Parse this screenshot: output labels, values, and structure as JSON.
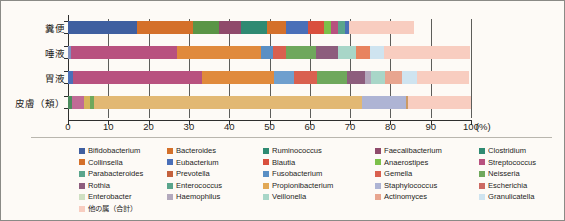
{
  "chart_data": {
    "type": "bar",
    "orientation": "horizontal",
    "stacked": true,
    "title": "",
    "xlabel": "(%)",
    "ylabel": "",
    "xlim": [
      0,
      100
    ],
    "xticks": [
      0,
      10,
      20,
      30,
      40,
      50,
      60,
      70,
      80,
      90,
      100
    ],
    "xtick_labels": [
      "0",
      "10",
      "20",
      "30",
      "40",
      "50",
      "60",
      "70",
      "80",
      "90",
      "100"
    ],
    "x_unit_label": "(%)",
    "grid": true,
    "grid_axis": "x",
    "legend_position": "below",
    "categories": [
      "糞便",
      "唾液",
      "胃液",
      "皮膚（頬）"
    ],
    "series": [
      {
        "name": "Bifidobacterium",
        "color": "#3f5fa0",
        "values": [
          17.0,
          0.0,
          0.8,
          0.0
        ]
      },
      {
        "name": "Bacteroides",
        "color": "#d4702a",
        "values": [
          31.0,
          0.0,
          0.0,
          0.0
        ]
      },
      {
        "name": "Ruminococcus",
        "color": "#5a9546",
        "values": [
          6.5,
          0.0,
          0.0,
          0.0
        ]
      },
      {
        "name": "Faecalibacterium",
        "color": "#8f4a6b",
        "values": [
          5.5,
          0.0,
          0.0,
          0.0
        ]
      },
      {
        "name": "Clostridium",
        "color": "#2f8a72",
        "values": [
          6.5,
          0.0,
          0.0,
          0.0
        ]
      },
      {
        "name": "Collinsella",
        "color": "#d4702a",
        "values": [
          4.5,
          0.0,
          0.0,
          0.0
        ]
      },
      {
        "name": "Eubacterium",
        "color": "#4a6fb8",
        "values": [
          5.5,
          0.0,
          0.0,
          0.0
        ]
      },
      {
        "name": "Blautia",
        "color": "#d94f3d",
        "values": [
          4.0,
          0.0,
          0.0,
          0.0
        ]
      },
      {
        "name": "Anaerostipes",
        "color": "#7cc04a",
        "values": [
          1.8,
          0.0,
          0.0,
          0.0
        ]
      },
      {
        "name": "Streptococcus",
        "color": "#b8517f",
        "values": [
          1.8,
          26.6,
          32.0,
          2.8
        ]
      },
      {
        "name": "Parabacteroides",
        "color": "#5aa58c",
        "values": [
          1.6,
          0.0,
          0.0,
          0.0
        ]
      },
      {
        "name": "Prevotella",
        "color": "#c4613d",
        "values": [
          0.0,
          21.0,
          18.0,
          0.0
        ]
      },
      {
        "name": "Fusobacterium",
        "color": "#5a8fc4",
        "values": [
          0.0,
          3.0,
          5.0,
          0.0
        ]
      },
      {
        "name": "Gemella",
        "color": "#d9604f",
        "values": [
          0.0,
          3.3,
          5.5,
          0.0
        ]
      },
      {
        "name": "Neisseria",
        "color": "#6fa85c",
        "values": [
          0.0,
          7.5,
          7.5,
          0.0
        ]
      },
      {
        "name": "Rothia",
        "color": "#8d5d7d",
        "values": [
          0.0,
          5.5,
          4.5,
          0.0
        ]
      },
      {
        "name": "Enterococcus",
        "color": "#5aa58c",
        "values": [
          0.0,
          0.0,
          1.8,
          0.0
        ]
      },
      {
        "name": "Propionibacterium",
        "color": "#e2a855",
        "values": [
          0.0,
          0.0,
          0.0,
          66.5
        ]
      },
      {
        "name": "Staphylococcus",
        "color": "#aeb4d4",
        "values": [
          0.0,
          0.0,
          0.0,
          11.0
        ]
      },
      {
        "name": "Escherichia",
        "color": "#cc6a63",
        "values": [
          0.0,
          0.0,
          0.0,
          0.0
        ]
      },
      {
        "name": "Enterobacter",
        "color": "#cfe0c2",
        "values": [
          0.0,
          0.0,
          0.0,
          0.0
        ]
      },
      {
        "name": "Haemophilus",
        "color": "#b3a9bd",
        "values": [
          0.0,
          0.0,
          0.6,
          0.0
        ]
      },
      {
        "name": "Veillonella",
        "color": "#a8d6c8",
        "values": [
          0.0,
          4.5,
          3.5,
          0.0
        ]
      },
      {
        "name": "Actinomyces",
        "color": "#e8a58f",
        "values": [
          0.0,
          3.5,
          4.2,
          0.0
        ]
      },
      {
        "name": "Granulicatella",
        "color": "#cfe4f0",
        "values": [
          0.0,
          3.5,
          3.5,
          0.0
        ]
      },
      {
        "name": "他の属（合計）",
        "color": "#f8cdc0",
        "values": [
          16.3,
          21.6,
          13.1,
          15.6
        ]
      }
    ]
  },
  "axis": {
    "y_labels": [
      "糞便",
      "唾液",
      "胃液",
      "皮膚（頬）"
    ],
    "x_tick_labels": [
      "0",
      "10",
      "20",
      "30",
      "40",
      "50",
      "60",
      "70",
      "80",
      "90",
      "100"
    ],
    "x_unit": "(%)"
  },
  "legend": {
    "rows": [
      [
        {
          "label": "Bifidobacterium",
          "color": "#3f5fa0"
        },
        {
          "label": "Bacteroides",
          "color": "#d4702a"
        },
        {
          "label": "Ruminococcus",
          "color": "#2f8a72"
        },
        {
          "label": "Faecalibacterium",
          "color": "#8f4a6b"
        },
        {
          "label": "Clostridium",
          "color": "#2f8a72"
        }
      ],
      [
        {
          "label": "Collinsella",
          "color": "#d4702a"
        },
        {
          "label": "Eubacterium",
          "color": "#4a6fb8"
        },
        {
          "label": "Blautia",
          "color": "#d94f3d"
        },
        {
          "label": "Anaerostipes",
          "color": "#7cc04a"
        },
        {
          "label": "Streptococcus",
          "color": "#b8517f"
        }
      ],
      [
        {
          "label": "Parabacteroides",
          "color": "#5aa58c"
        },
        {
          "label": "Prevotella",
          "color": "#c4613d"
        },
        {
          "label": "Fusobacterium",
          "color": "#5a8fc4"
        },
        {
          "label": "Gemella",
          "color": "#d9604f"
        },
        {
          "label": "Neisseria",
          "color": "#6fa85c"
        }
      ],
      [
        {
          "label": "Rothia",
          "color": "#8d5d7d"
        },
        {
          "label": "Enterococcus",
          "color": "#5aa58c"
        },
        {
          "label": "Propionibacterium",
          "color": "#e2a855"
        },
        {
          "label": "Staphylococcus",
          "color": "#aeb4d4"
        },
        {
          "label": "Escherichia",
          "color": "#cc6a63"
        }
      ],
      [
        {
          "label": "Enterobacter",
          "color": "#cfe0c2"
        },
        {
          "label": "Haemophilus",
          "color": "#b3a9bd"
        },
        {
          "label": "Veillonella",
          "color": "#a8d6c8"
        },
        {
          "label": "Actinomyces",
          "color": "#e8a58f"
        },
        {
          "label": "Granulicatella",
          "color": "#cfe4f0"
        }
      ],
      [
        {
          "label": "他の属（合計）",
          "color": "#f8cdc0"
        }
      ]
    ]
  },
  "bars": [
    {
      "category": "糞便",
      "segments": [
        {
          "name": "Bifidobacterium",
          "value": 17.0,
          "color": "#3f5fa0"
        },
        {
          "name": "Bacteroides",
          "value": 14.0,
          "color": "#d4702a"
        },
        {
          "name": "Ruminococcus",
          "value": 6.5,
          "color": "#5a9546"
        },
        {
          "name": "Faecalibacterium",
          "value": 5.5,
          "color": "#8f4a6b"
        },
        {
          "name": "Clostridium",
          "value": 6.5,
          "color": "#2f8a72"
        },
        {
          "name": "Collinsella",
          "value": 4.5,
          "color": "#d4702a"
        },
        {
          "name": "Eubacterium",
          "value": 5.5,
          "color": "#4a6fb8"
        },
        {
          "name": "Blautia",
          "value": 4.0,
          "color": "#d94f3d"
        },
        {
          "name": "Anaerostipes",
          "value": 1.8,
          "color": "#7cc04a"
        },
        {
          "name": "Streptococcus",
          "value": 1.8,
          "color": "#b8517f"
        },
        {
          "name": "Parabacteroides",
          "value": 1.6,
          "color": "#5aa58c"
        },
        {
          "name": "Eubacterium2",
          "value": 1.0,
          "color": "#4a6fb8"
        },
        {
          "name": "他の属（合計）",
          "value": 16.3,
          "color": "#f8cdc0"
        },
        {
          "name": "blank",
          "value": 14.0,
          "color": "transparent"
        }
      ]
    },
    {
      "category": "唾液",
      "segments": [
        {
          "name": "Bifidobacterium",
          "value": 0.8,
          "color": "#8090bf"
        },
        {
          "name": "Streptococcus",
          "value": 26.6,
          "color": "#b8517f"
        },
        {
          "name": "Prevotella",
          "value": 21.0,
          "color": "#e08a3c"
        },
        {
          "name": "Fusobacterium",
          "value": 3.0,
          "color": "#5a8fc4"
        },
        {
          "name": "Gemella",
          "value": 3.3,
          "color": "#d9604f"
        },
        {
          "name": "Neisseria",
          "value": 7.5,
          "color": "#6fa85c"
        },
        {
          "name": "Rothia",
          "value": 5.5,
          "color": "#8d5d7d"
        },
        {
          "name": "Veillonella",
          "value": 4.5,
          "color": "#a8d6c8"
        },
        {
          "name": "Actinomyces",
          "value": 3.5,
          "color": "#e8835f"
        },
        {
          "name": "Granulicatella",
          "value": 3.5,
          "color": "#cfe4f0"
        },
        {
          "name": "他の属（合計）",
          "value": 21.6,
          "color": "#f8cdc0"
        },
        {
          "name": "blank",
          "value": 0.2,
          "color": "transparent"
        }
      ]
    },
    {
      "category": "胃液",
      "segments": [
        {
          "name": "Bifidobacterium",
          "value": 1.2,
          "color": "#4a6fb8"
        },
        {
          "name": "Streptococcus",
          "value": 32.0,
          "color": "#b8517f"
        },
        {
          "name": "Prevotella",
          "value": 18.0,
          "color": "#e08a3c"
        },
        {
          "name": "Fusobacterium",
          "value": 5.0,
          "color": "#6f9fce"
        },
        {
          "name": "Gemella",
          "value": 5.5,
          "color": "#d9604f"
        },
        {
          "name": "Neisseria",
          "value": 7.5,
          "color": "#6fa85c"
        },
        {
          "name": "Rothia",
          "value": 4.5,
          "color": "#8d5d7d"
        },
        {
          "name": "Haemophilus",
          "value": 1.6,
          "color": "#b3a9bd"
        },
        {
          "name": "Veillonella",
          "value": 3.5,
          "color": "#a8d6c8"
        },
        {
          "name": "Actinomyces",
          "value": 4.2,
          "color": "#e8a58f"
        },
        {
          "name": "Granulicatella",
          "value": 3.5,
          "color": "#cfe4f0"
        },
        {
          "name": "他の属（合計）",
          "value": 13.1,
          "color": "#f8cdc0"
        },
        {
          "name": "blank",
          "value": 0.4,
          "color": "transparent"
        }
      ]
    },
    {
      "category": "皮膚（頬）",
      "segments": [
        {
          "name": "Clostridium",
          "value": 1.1,
          "color": "#4d8c5e"
        },
        {
          "name": "Streptococcus",
          "value": 2.8,
          "color": "#c06a96"
        },
        {
          "name": "Propionibacterium",
          "value": 1.6,
          "color": "#d6b45a"
        },
        {
          "name": "Neisseria",
          "value": 0.9,
          "color": "#6fa85c"
        },
        {
          "name": "Propionibacterium2",
          "value": 66.5,
          "color": "#e2b873"
        },
        {
          "name": "Staphylococcus",
          "value": 11.0,
          "color": "#aeb4d4"
        },
        {
          "name": "Escherichia",
          "value": 0.5,
          "color": "#cc9a63"
        },
        {
          "name": "他の属（合計）",
          "value": 15.6,
          "color": "#f8cdc0"
        }
      ]
    }
  ]
}
